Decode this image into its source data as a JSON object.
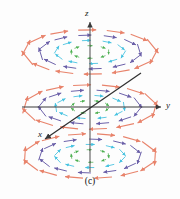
{
  "figure": {
    "caption": "(c)",
    "axes": {
      "z_label": "z",
      "y_label": "y",
      "x_label": "x",
      "axis_color": "#3a3a3a"
    },
    "colors": {
      "ring_inner": "#4caf50",
      "ring_mid_inner": "#45c2e0",
      "ring_mid_outer": "#6a5fa8",
      "ring_outer": "#e8836b",
      "axis": "#3a3a3a",
      "background": "#fdfdfd"
    }
  },
  "chart_data": {
    "type": "scatter",
    "title": "(c)",
    "subtitle": "",
    "xlabel": "x",
    "ylabel": "y",
    "zlabel": "z",
    "grid": false,
    "legend": "none",
    "projection": "oblique-3d",
    "origin_px": [
      90,
      107
    ],
    "axis_endpoints_px": {
      "z_positive": [
        90,
        20
      ],
      "z_negative": [
        90,
        172
      ],
      "y_positive": [
        162,
        107
      ],
      "y_negative": [
        22,
        107
      ],
      "x_positive": [
        44,
        140
      ],
      "x_negative": [
        140,
        74
      ]
    },
    "planes": [
      {
        "name": "upper plane",
        "z": 1,
        "center_px": [
          90,
          52
        ],
        "ellipse_rx": 62,
        "ellipse_ry": 21
      },
      {
        "name": "middle plane",
        "z": 0,
        "center_px": [
          90,
          107
        ],
        "ellipse_rx": 62,
        "ellipse_ry": 21
      },
      {
        "name": "lower plane",
        "z": -1,
        "center_px": [
          90,
          156
        ],
        "ellipse_rx": 62,
        "ellipse_ry": 21
      }
    ],
    "rings": [
      {
        "name": "ring 1 (innermost)",
        "radius": 0.3,
        "color": "#4caf50",
        "arrow_count": 8,
        "arrow_length_px": 5,
        "orientation": "counter-clockwise"
      },
      {
        "name": "ring 2",
        "radius": 0.55,
        "color": "#45c2e0",
        "arrow_count": 10,
        "arrow_length_px": 9,
        "orientation": "counter-clockwise"
      },
      {
        "name": "ring 3",
        "radius": 0.8,
        "color": "#6a5fa8",
        "arrow_count": 12,
        "arrow_length_px": 13,
        "orientation": "counter-clockwise"
      },
      {
        "name": "ring 4 (outermost)",
        "radius": 1.05,
        "color": "#e8836b",
        "arrow_count": 14,
        "arrow_length_px": 18,
        "orientation": "counter-clockwise"
      }
    ],
    "series": [
      {
        "name": "inner ring arrows",
        "color": "#4caf50",
        "values": [
          0.3,
          0.3,
          0.3,
          0.3,
          0.3,
          0.3,
          0.3,
          0.3
        ]
      },
      {
        "name": "second ring arrows",
        "color": "#45c2e0",
        "values": [
          0.55,
          0.55,
          0.55,
          0.55,
          0.55,
          0.55,
          0.55,
          0.55,
          0.55,
          0.55
        ]
      },
      {
        "name": "third ring arrows",
        "color": "#6a5fa8",
        "values": [
          0.8,
          0.8,
          0.8,
          0.8,
          0.8,
          0.8,
          0.8,
          0.8,
          0.8,
          0.8,
          0.8,
          0.8
        ]
      },
      {
        "name": "outer ring arrows",
        "color": "#e8836b",
        "values": [
          1.05,
          1.05,
          1.05,
          1.05,
          1.05,
          1.05,
          1.05,
          1.05,
          1.05,
          1.05,
          1.05,
          1.05,
          1.05,
          1.05
        ]
      }
    ]
  }
}
